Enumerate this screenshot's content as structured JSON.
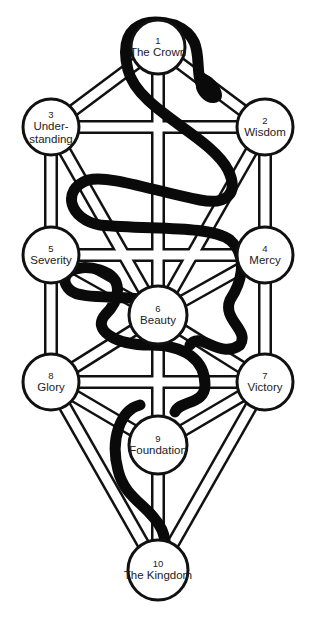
{
  "colors": {
    "line": "#111111",
    "node_fill": "#ffffff",
    "snake": "#0a0a0a",
    "background": "#ffffff"
  },
  "sephirot": [
    {
      "number": "1",
      "name": "The Crown",
      "cx": 158,
      "cy": 47,
      "r": 27
    },
    {
      "number": "2",
      "name": "Wisdom",
      "cx": 265,
      "cy": 127,
      "r": 28
    },
    {
      "number": "3",
      "name": "Under-\nstanding",
      "line1": "Under-",
      "line2": "standing",
      "cx": 51,
      "cy": 127,
      "r": 28
    },
    {
      "number": "4",
      "name": "Mercy",
      "cx": 265,
      "cy": 255,
      "r": 28
    },
    {
      "number": "5",
      "name": "Severity",
      "cx": 51,
      "cy": 255,
      "r": 28
    },
    {
      "number": "6",
      "name": "Beauty",
      "cx": 158,
      "cy": 315,
      "r": 29
    },
    {
      "number": "7",
      "name": "Victory",
      "cx": 265,
      "cy": 382,
      "r": 28
    },
    {
      "number": "8",
      "name": "Glory",
      "cx": 51,
      "cy": 382,
      "r": 28
    },
    {
      "number": "9",
      "name": "Foundation",
      "cx": 158,
      "cy": 445,
      "r": 29
    },
    {
      "number": "10",
      "name": "The Kingdom",
      "cx": 158,
      "cy": 570,
      "r": 30
    }
  ],
  "paths": [
    [
      1,
      2
    ],
    [
      1,
      3
    ],
    [
      1,
      6
    ],
    [
      2,
      3
    ],
    [
      2,
      4
    ],
    [
      2,
      6
    ],
    [
      3,
      5
    ],
    [
      3,
      6
    ],
    [
      4,
      5
    ],
    [
      4,
      6
    ],
    [
      4,
      7
    ],
    [
      5,
      6
    ],
    [
      5,
      8
    ],
    [
      6,
      7
    ],
    [
      6,
      8
    ],
    [
      6,
      9
    ],
    [
      7,
      8
    ],
    [
      7,
      9
    ],
    [
      7,
      10
    ],
    [
      8,
      9
    ],
    [
      8,
      10
    ],
    [
      9,
      10
    ]
  ]
}
